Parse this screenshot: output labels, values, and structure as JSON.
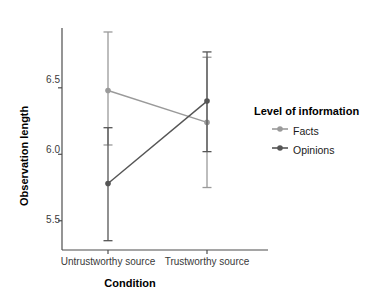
{
  "chart_data": {
    "type": "line",
    "title": "",
    "xlabel": "Condition",
    "ylabel": "Observation length",
    "categories": [
      "Untrustworthy source",
      "Trustworthy source"
    ],
    "x_tick_labels": [
      "Untrustworthy source",
      "Trustworthy source"
    ],
    "y_tick_labels": [
      "5.5",
      "6.0",
      "6.5"
    ],
    "y_ticks": [
      5.5,
      6.0,
      6.5
    ],
    "ylim": [
      5.28,
      6.95
    ],
    "grid": false,
    "legend_position": "right",
    "legend_title": "Level of information",
    "series": [
      {
        "name": "Facts",
        "color": "#9a9a9a",
        "values": [
          6.48,
          6.24
        ],
        "error_low": [
          6.07,
          5.75
        ],
        "error_high": [
          6.92,
          6.73
        ]
      },
      {
        "name": "Opinions",
        "color": "#555555",
        "values": [
          5.78,
          6.4
        ],
        "error_low": [
          5.35,
          6.02
        ],
        "error_high": [
          6.2,
          6.77
        ]
      }
    ]
  },
  "axes": {
    "y_title": "Observation length",
    "x_title": "Condition",
    "y_tick_0": "5.5",
    "y_tick_1": "6.0",
    "y_tick_2": "6.5",
    "x_tick_0": "Untrustworthy source",
    "x_tick_1": "Trustworthy source"
  },
  "legend": {
    "title": "Level of information",
    "items": [
      {
        "label": "Facts",
        "color": "#9a9a9a"
      },
      {
        "label": "Opinions",
        "color": "#555555"
      }
    ]
  },
  "colors": {
    "facts": "#9a9a9a",
    "opinions": "#555555",
    "axis": "#4d4d4d",
    "text": "#1a1a1a"
  }
}
